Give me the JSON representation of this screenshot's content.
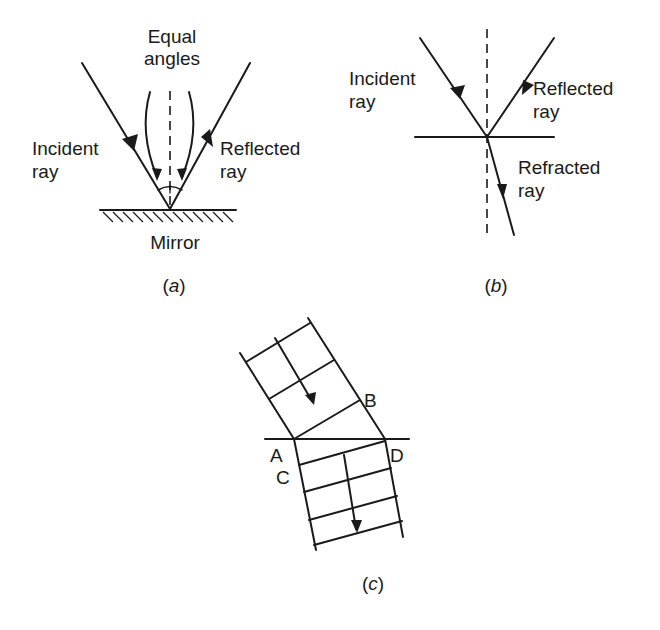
{
  "figure_a": {
    "title_line1": "Equal",
    "title_line2": "angles",
    "incident_line1": "Incident",
    "incident_line2": "ray",
    "reflected_line1": "Reflected",
    "reflected_line2": "ray",
    "surface": "Mirror",
    "caption_open": "(",
    "caption_letter": "a",
    "caption_close": ")"
  },
  "figure_b": {
    "incident_line1": "Incident",
    "incident_line2": "ray",
    "reflected_line1": "Reflected",
    "reflected_line2": "ray",
    "refracted_line1": "Refracted",
    "refracted_line2": "ray",
    "caption_open": "(",
    "caption_letter": "b",
    "caption_close": ")"
  },
  "figure_c": {
    "point_a": "A",
    "point_b": "B",
    "point_c": "C",
    "point_d": "D",
    "caption_open": "(",
    "caption_letter": "c",
    "caption_close": ")"
  },
  "colors": {
    "ink": "#1a1a1a",
    "background": "#ffffff"
  }
}
